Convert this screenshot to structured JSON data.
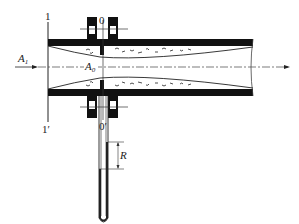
{
  "diagram": {
    "labels": {
      "section_1_top": "1",
      "section_1_bottom": "1′",
      "section_0_top": "0",
      "section_0_bottom": "0′",
      "area_1_main": "A",
      "area_1_sub": "1",
      "area_0_main": "A",
      "area_0_sub": "0",
      "manometer_reading": "R"
    },
    "colors": {
      "wall": "#111111",
      "line": "#333333",
      "background": "#ffffff"
    }
  }
}
